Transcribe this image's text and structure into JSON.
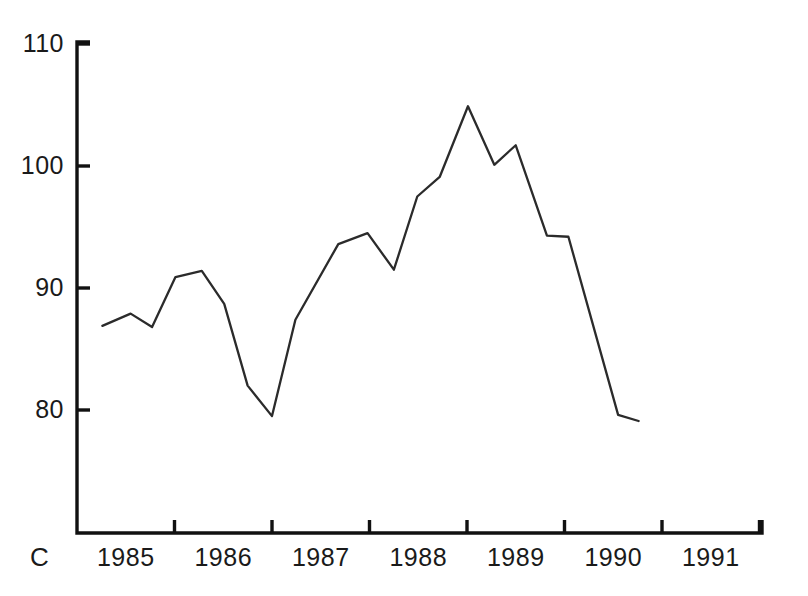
{
  "chart_data": {
    "type": "line",
    "title": "",
    "subtitle": "",
    "xlabel": "",
    "ylabel": "",
    "corner_label": "C",
    "grid": false,
    "legend": "none",
    "line_color": "#2b2b2b",
    "axis_color": "#111111",
    "background": "#ffffff",
    "ylim": [
      72.5,
      111.5
    ],
    "yticks": [
      80,
      90,
      100,
      110
    ],
    "ytick_labels": [
      "80",
      "90",
      "100",
      "110"
    ],
    "xlim": [
      1984.75,
      1991.85
    ],
    "xticks": [
      1984.75,
      1985.75,
      1986.75,
      1987.75,
      1988.75,
      1989.75,
      1990.75,
      1991.75
    ],
    "xtick_labels": [
      "1985",
      "1986",
      "1987",
      "1988",
      "1989",
      "1990",
      "1991"
    ],
    "xtick_label_positions": [
      1985.25,
      1986.25,
      1987.25,
      1988.25,
      1989.25,
      1990.25,
      1991.25
    ],
    "x": [
      1985.01,
      1985.3,
      1985.52,
      1985.76,
      1986.03,
      1986.26,
      1986.5,
      1986.75,
      1986.99,
      1987.43,
      1987.73,
      1988.0,
      1988.24,
      1988.47,
      1988.76,
      1989.03,
      1989.25,
      1989.57,
      1989.79,
      1990.3,
      1990.51
    ],
    "values": [
      86.9,
      87.9,
      86.8,
      90.9,
      91.4,
      88.7,
      82.0,
      79.5,
      87.4,
      93.6,
      94.5,
      91.5,
      97.5,
      99.1,
      104.9,
      100.1,
      101.7,
      94.3,
      94.2,
      79.6,
      79.1
    ],
    "series": [
      {
        "name": "series-1",
        "values": [
          86.9,
          87.9,
          86.8,
          90.9,
          91.4,
          88.7,
          82.0,
          79.5,
          87.4,
          93.6,
          94.5,
          91.5,
          97.5,
          99.1,
          104.9,
          100.1,
          101.7,
          94.3,
          94.2,
          79.6,
          79.1
        ]
      }
    ],
    "annotations": []
  },
  "geometry": {
    "axis_x": 77,
    "axis_top": 42,
    "axis_bottom": 533,
    "axis_right": 762,
    "y_value_at_pixel_288": 90,
    "pixels_per_unit": 12.2,
    "x_pixel_at_1984_75": 77,
    "pixels_per_year": 97.5,
    "tick_len": 13
  }
}
